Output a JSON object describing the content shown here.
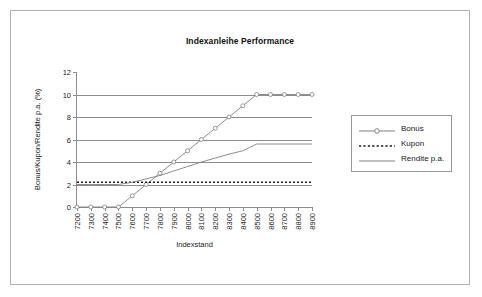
{
  "chart_data": {
    "type": "line",
    "title": "Indexanleihe Performance",
    "xlabel": "Indexstand",
    "ylabel": "Bonus/Kupon/Rendite p.a.  (%)",
    "grid": true,
    "legend_position": "right",
    "xlim": [
      7200,
      8900
    ],
    "ylim": [
      0,
      12
    ],
    "ytick_labels": [
      "0",
      "2",
      "4",
      "6",
      "8",
      "10",
      "12"
    ],
    "yticks": [
      0,
      2,
      4,
      6,
      8,
      10,
      12
    ],
    "x": [
      7200,
      7300,
      7400,
      7500,
      7600,
      7700,
      7800,
      7900,
      8000,
      8100,
      8200,
      8300,
      8400,
      8500,
      8600,
      8700,
      8800,
      8900
    ],
    "categories": [
      "7200",
      "7300",
      "7400",
      "7500",
      "7600",
      "7700",
      "7800",
      "7900",
      "8000",
      "8100",
      "8200",
      "8300",
      "8400",
      "8500",
      "8600",
      "8700",
      "8800",
      "8900"
    ],
    "series": [
      {
        "name": "Bonus",
        "style": "line-marker",
        "marker": "circle-open",
        "color": "#808080",
        "values": [
          0,
          0,
          0,
          0,
          1,
          2,
          3,
          4,
          5,
          6,
          7,
          8,
          9,
          10,
          10,
          10,
          10,
          10
        ]
      },
      {
        "name": "Kupon",
        "style": "dotted",
        "marker": "none",
        "color": "#1a1a1a",
        "values": [
          2.2,
          2.2,
          2.2,
          2.2,
          2.2,
          2.2,
          2.2,
          2.2,
          2.2,
          2.2,
          2.2,
          2.2,
          2.2,
          2.2,
          2.2,
          2.2,
          2.2,
          2.2
        ]
      },
      {
        "name": "Rendite p.a.",
        "style": "solid",
        "marker": "none",
        "color": "#808080",
        "values": [
          2.0,
          2.0,
          2.0,
          2.0,
          2.2,
          2.5,
          2.8,
          3.2,
          3.6,
          4.0,
          4.35,
          4.7,
          5.0,
          5.6,
          5.6,
          5.6,
          5.6,
          5.6
        ]
      }
    ]
  },
  "legend": {
    "entries": [
      {
        "label": "Bonus"
      },
      {
        "label": "Kupon"
      },
      {
        "label": "Rendite p.a."
      }
    ]
  },
  "colors": {
    "frame_border": "#b0b0b0",
    "axis": "#8c8c8c",
    "gridline": "#8c8c8c",
    "series_gray": "#808080",
    "series_dark": "#1a1a1a",
    "background": "#ffffff"
  }
}
